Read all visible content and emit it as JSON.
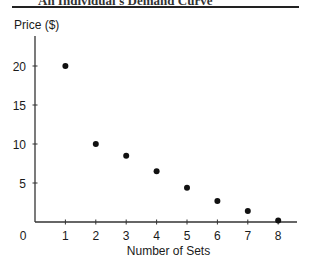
{
  "header": {
    "text": "An Individual's Demand Curve"
  },
  "chart_data": {
    "type": "scatter",
    "title": "",
    "xlabel": "Number of Sets",
    "ylabel": "Price ($)",
    "x": [
      1,
      2,
      3,
      4,
      5,
      6,
      7,
      8
    ],
    "y": [
      20,
      10,
      8.5,
      6.5,
      4.4,
      2.7,
      1.4,
      0.2
    ],
    "x_ticks": [
      "1",
      "2",
      "3",
      "4",
      "5",
      "6",
      "7",
      "8"
    ],
    "y_ticks": [
      "5",
      "10",
      "15",
      "20"
    ],
    "origin_label": "0",
    "xlim": [
      0,
      8.6
    ],
    "ylim": [
      0,
      25
    ],
    "grid": false,
    "legend": null
  }
}
